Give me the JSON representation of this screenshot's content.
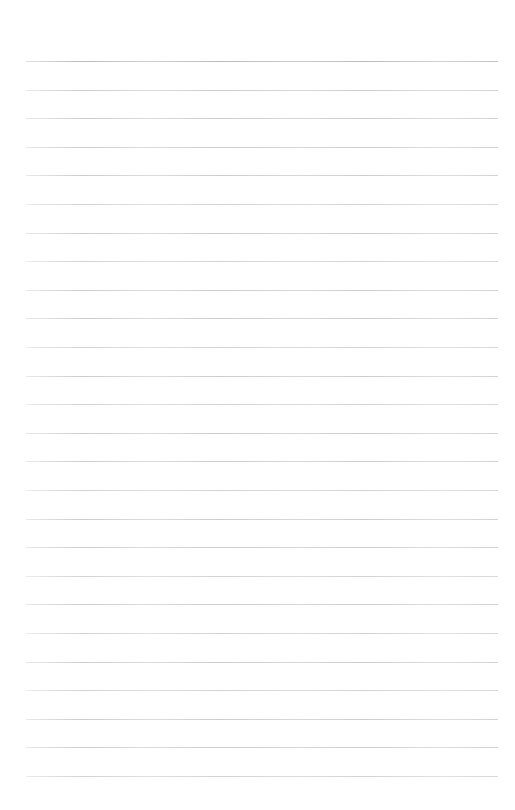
{
  "page": {
    "kind": "ruled-paper",
    "title": "",
    "background_color": "#ffffff",
    "width": 515,
    "height": 810,
    "content_text": ""
  },
  "ruling": {
    "line_color": "#c9cbcd",
    "heavy_line_color": "#b9bbbe",
    "line_count": 26,
    "line_thickness_px": 1,
    "line_spacing_px": 28.6,
    "first_line_y_px": 61,
    "left_margin_px": 26,
    "right_edge_px": 498,
    "line_width_px": 472,
    "lines": [
      {
        "index": 1,
        "y": 61,
        "weight": "heavy"
      },
      {
        "index": 2,
        "y": 89.6,
        "weight": "normal"
      },
      {
        "index": 3,
        "y": 118.2,
        "weight": "normal"
      },
      {
        "index": 4,
        "y": 146.8,
        "weight": "normal"
      },
      {
        "index": 5,
        "y": 175.4,
        "weight": "normal"
      },
      {
        "index": 6,
        "y": 204.0,
        "weight": "soft"
      },
      {
        "index": 7,
        "y": 232.6,
        "weight": "normal"
      },
      {
        "index": 8,
        "y": 261.2,
        "weight": "soft"
      },
      {
        "index": 9,
        "y": 289.8,
        "weight": "normal"
      },
      {
        "index": 10,
        "y": 318.4,
        "weight": "normal"
      },
      {
        "index": 11,
        "y": 347.0,
        "weight": "soft"
      },
      {
        "index": 12,
        "y": 375.6,
        "weight": "normal"
      },
      {
        "index": 13,
        "y": 404.2,
        "weight": "soft"
      },
      {
        "index": 14,
        "y": 432.8,
        "weight": "normal"
      },
      {
        "index": 15,
        "y": 461.4,
        "weight": "normal"
      },
      {
        "index": 16,
        "y": 490.0,
        "weight": "soft"
      },
      {
        "index": 17,
        "y": 518.6,
        "weight": "normal"
      },
      {
        "index": 18,
        "y": 547.2,
        "weight": "normal"
      },
      {
        "index": 19,
        "y": 575.8,
        "weight": "soft"
      },
      {
        "index": 20,
        "y": 604.4,
        "weight": "normal"
      },
      {
        "index": 21,
        "y": 633.0,
        "weight": "soft"
      },
      {
        "index": 22,
        "y": 661.6,
        "weight": "normal"
      },
      {
        "index": 23,
        "y": 690.2,
        "weight": "soft"
      },
      {
        "index": 24,
        "y": 718.8,
        "weight": "normal"
      },
      {
        "index": 25,
        "y": 747.4,
        "weight": "normal"
      },
      {
        "index": 26,
        "y": 776.0,
        "weight": "soft"
      }
    ]
  }
}
